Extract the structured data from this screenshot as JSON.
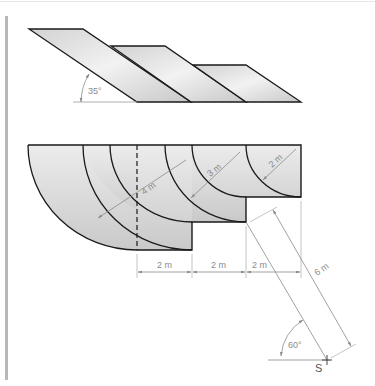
{
  "figure": {
    "top_view": {
      "angle_label": "35°",
      "parallelograms": 3
    },
    "bottom_view": {
      "radius_labels": [
        "4 m",
        "3 m",
        "2 m"
      ],
      "width_labels": [
        "2 m",
        "2 m",
        "2 m"
      ],
      "length_label": "6 m",
      "angle_label": "60°",
      "point_label": "S"
    },
    "colors": {
      "fill_light": "#efefef",
      "fill_dark": "#cfcfcf",
      "outline": "#1a1a1a",
      "dimension": "#8a8a8a"
    }
  }
}
